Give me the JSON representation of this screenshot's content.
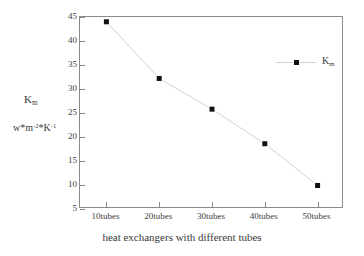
{
  "chart_data": {
    "type": "line",
    "title": "",
    "categories": [
      "10tubes",
      "20tubes",
      "30tubes",
      "40tubes",
      "50tubes"
    ],
    "values": [
      44.0,
      32.2,
      25.8,
      18.6,
      9.9
    ],
    "series": [
      {
        "name": "Km",
        "name_base": "K",
        "name_sub": "m",
        "values": [
          44.0,
          32.2,
          25.8,
          18.6,
          9.9
        ],
        "marker": "filled-square",
        "marker_color": "#111111",
        "line_color": "#d2d2d2"
      }
    ],
    "xlabel": "heat exchangers with different tubes",
    "ylabel_symbol_base": "K",
    "ylabel_symbol_sub": "m",
    "ylabel_units": "w*m⁻²*K⁻¹",
    "ylabel_units_parts": {
      "prefix": "w*m",
      "exp1": "-2",
      "mid": "*K",
      "exp2": "-1"
    },
    "ylim": [
      5,
      45
    ],
    "ytick_step": 5,
    "yticks": [
      45,
      40,
      35,
      30,
      25,
      20,
      15,
      10,
      5
    ],
    "grid": false,
    "legend_position": "inside-top-right",
    "legend_entries": [
      "Km"
    ],
    "frame_color": "#8a8a8a",
    "background": "#ffffff"
  }
}
